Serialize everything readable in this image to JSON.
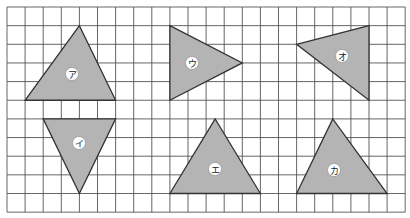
{
  "diagram": {
    "grid": {
      "x0": 7,
      "y0": 7,
      "cols": 22,
      "rows": 11,
      "cell_w": 18.1,
      "cell_h": 18.65,
      "line_color": "#555555"
    },
    "shape_fill": "#b4b4b4",
    "shapes": [
      {
        "id": "a",
        "label": "ア",
        "points": [
          [
            4,
            1
          ],
          [
            1,
            5
          ],
          [
            6,
            5
          ]
        ],
        "label_pos": [
          72,
          74
        ]
      },
      {
        "id": "i",
        "label": "イ",
        "points": [
          [
            2,
            6
          ],
          [
            6,
            6
          ],
          [
            4,
            10
          ]
        ],
        "label_pos": [
          79,
          143
        ]
      },
      {
        "id": "u",
        "label": "ウ",
        "points": [
          [
            9,
            1
          ],
          [
            9,
            5
          ],
          [
            13,
            3
          ]
        ],
        "label_pos": [
          192,
          63
        ]
      },
      {
        "id": "o",
        "label": "オ",
        "points": [
          [
            16,
            2
          ],
          [
            20,
            1
          ],
          [
            20,
            5
          ]
        ],
        "label_pos": [
          342,
          56
        ]
      },
      {
        "id": "e",
        "label": "エ",
        "points": [
          [
            11.5,
            6
          ],
          [
            9,
            10
          ],
          [
            14,
            10
          ]
        ],
        "label_pos": [
          215,
          169
        ]
      },
      {
        "id": "ka",
        "label": "カ",
        "points": [
          [
            18,
            6
          ],
          [
            16,
            10
          ],
          [
            21,
            10
          ]
        ],
        "label_pos": [
          334,
          170
        ]
      }
    ]
  }
}
